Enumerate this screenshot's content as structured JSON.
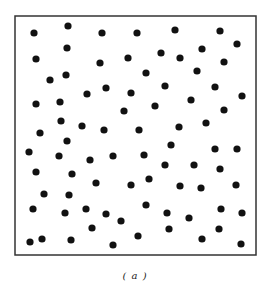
{
  "figure": {
    "caption": "( a )",
    "frame": {
      "x": 15,
      "y": 16,
      "width": 241,
      "height": 239,
      "stroke": "#333333",
      "stroke_width": 1.5
    },
    "dot_color": "#111111",
    "dot_radius": 3.6,
    "points": [
      [
        34,
        33
      ],
      [
        68,
        26
      ],
      [
        102,
        33
      ],
      [
        137,
        33
      ],
      [
        175,
        30
      ],
      [
        220,
        31
      ],
      [
        67,
        48
      ],
      [
        36,
        59
      ],
      [
        100,
        63
      ],
      [
        128,
        58
      ],
      [
        161,
        53
      ],
      [
        202,
        49
      ],
      [
        180,
        58
      ],
      [
        237,
        44
      ],
      [
        224,
        62
      ],
      [
        50,
        80
      ],
      [
        66,
        75
      ],
      [
        106,
        88
      ],
      [
        87,
        94
      ],
      [
        131,
        93
      ],
      [
        146,
        73
      ],
      [
        197,
        71
      ],
      [
        165,
        86
      ],
      [
        215,
        87
      ],
      [
        242,
        96
      ],
      [
        36,
        104
      ],
      [
        60,
        102
      ],
      [
        124,
        111
      ],
      [
        155,
        106
      ],
      [
        191,
        100
      ],
      [
        224,
        110
      ],
      [
        61,
        121
      ],
      [
        82,
        126
      ],
      [
        104,
        130
      ],
      [
        40,
        133
      ],
      [
        139,
        130
      ],
      [
        179,
        127
      ],
      [
        206,
        123
      ],
      [
        67,
        141
      ],
      [
        29,
        152
      ],
      [
        59,
        156
      ],
      [
        90,
        160
      ],
      [
        113,
        156
      ],
      [
        144,
        155
      ],
      [
        171,
        145
      ],
      [
        215,
        149
      ],
      [
        237,
        149
      ],
      [
        36,
        172
      ],
      [
        72,
        174
      ],
      [
        165,
        165
      ],
      [
        194,
        165
      ],
      [
        220,
        169
      ],
      [
        96,
        183
      ],
      [
        131,
        185
      ],
      [
        149,
        179
      ],
      [
        180,
        186
      ],
      [
        201,
        188
      ],
      [
        236,
        185
      ],
      [
        44,
        194
      ],
      [
        69,
        195
      ],
      [
        146,
        205
      ],
      [
        33,
        209
      ],
      [
        65,
        213
      ],
      [
        86,
        209
      ],
      [
        106,
        214
      ],
      [
        167,
        213
      ],
      [
        189,
        218
      ],
      [
        221,
        209
      ],
      [
        242,
        213
      ],
      [
        121,
        221
      ],
      [
        92,
        228
      ],
      [
        169,
        229
      ],
      [
        219,
        229
      ],
      [
        30,
        242
      ],
      [
        42,
        239
      ],
      [
        71,
        240
      ],
      [
        113,
        245
      ],
      [
        138,
        236
      ],
      [
        202,
        239
      ],
      [
        241,
        244
      ]
    ]
  }
}
